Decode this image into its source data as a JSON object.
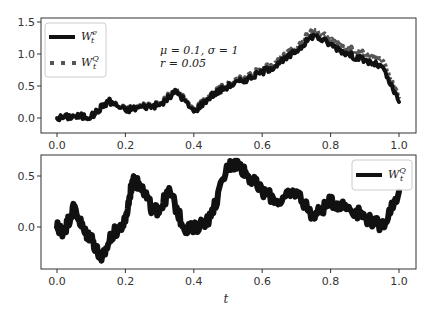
{
  "chart_data": [
    {
      "type": "line",
      "panel": "top",
      "title": "",
      "xlabel": "",
      "ylabel": "",
      "xlim": [
        -0.05,
        1.05
      ],
      "ylim": [
        -0.3,
        1.6
      ],
      "xticks": [
        "0.0",
        "0.2",
        "0.4",
        "0.6",
        "0.8",
        "1.0"
      ],
      "yticks": [
        "0.0",
        "0.5",
        "1.0",
        "1.5"
      ],
      "grid": false,
      "legend_position": "upper left",
      "annotation": {
        "line1": "μ = 0.1, σ = 1",
        "line2": "r = 0.05"
      },
      "x": [
        0,
        0.05,
        0.1,
        0.15,
        0.2,
        0.25,
        0.3,
        0.35,
        0.4,
        0.45,
        0.5,
        0.55,
        0.6,
        0.65,
        0.7,
        0.75,
        0.8,
        0.85,
        0.9,
        0.95,
        1.0
      ],
      "series": [
        {
          "name": "W_t^e",
          "style": "solid",
          "color": "#111111",
          "values": [
            0.0,
            0.03,
            0.02,
            0.27,
            0.12,
            0.18,
            0.2,
            0.42,
            0.1,
            0.35,
            0.5,
            0.6,
            0.72,
            0.85,
            1.05,
            1.3,
            1.15,
            1.0,
            0.9,
            0.8,
            0.25
          ]
        },
        {
          "name": "W_t^Q",
          "style": "dotted",
          "color": "#555555",
          "values": [
            0.0,
            0.03,
            0.02,
            0.27,
            0.13,
            0.19,
            0.22,
            0.44,
            0.12,
            0.37,
            0.53,
            0.63,
            0.76,
            0.9,
            1.1,
            1.38,
            1.22,
            1.08,
            1.0,
            0.9,
            0.3
          ]
        }
      ]
    },
    {
      "type": "line",
      "panel": "bottom",
      "title": "",
      "xlabel": "t",
      "ylabel": "",
      "xlim": [
        -0.05,
        1.05
      ],
      "ylim": [
        -0.42,
        0.7
      ],
      "xticks": [
        "0.0",
        "0.2",
        "0.4",
        "0.6",
        "0.8",
        "1.0"
      ],
      "yticks": [
        "0.0",
        "0.5"
      ],
      "grid": false,
      "legend_position": "upper right",
      "x": [
        0,
        0.02,
        0.05,
        0.08,
        0.1,
        0.13,
        0.16,
        0.2,
        0.22,
        0.25,
        0.28,
        0.3,
        0.33,
        0.37,
        0.4,
        0.45,
        0.5,
        0.53,
        0.56,
        0.6,
        0.65,
        0.7,
        0.75,
        0.8,
        0.85,
        0.9,
        0.95,
        1.0
      ],
      "series": [
        {
          "name": "W_t^Q",
          "style": "solid",
          "color": "#111111",
          "values": [
            0.0,
            -0.05,
            0.2,
            -0.05,
            -0.1,
            -0.33,
            -0.08,
            0.05,
            0.45,
            0.4,
            0.15,
            0.18,
            0.35,
            0.0,
            -0.02,
            0.1,
            0.6,
            0.62,
            0.5,
            0.35,
            0.25,
            0.35,
            0.1,
            0.25,
            0.2,
            0.1,
            0.0,
            0.35
          ]
        }
      ]
    }
  ],
  "legend_top": [
    {
      "label": "W",
      "sup": "e",
      "sub": "t",
      "style": "solid"
    },
    {
      "label": "W",
      "sup": "Q",
      "sub": "t",
      "style": "dotted"
    }
  ],
  "legend_bottom": [
    {
      "label": "W",
      "sup": "Q",
      "sub": "t",
      "style": "solid"
    }
  ],
  "annotation": {
    "line1": "μ = 0.1, σ = 1",
    "line2": "r = 0.05"
  },
  "xlabel": "t"
}
